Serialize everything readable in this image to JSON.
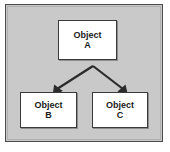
{
  "diagram": {
    "type": "hierarchy-tree",
    "title": "",
    "background_color": "#c9c9c9",
    "node_fill_color": "#ffffff",
    "node_border_color": "#3a3a3a",
    "arrow_color": "#2b2b2b",
    "nodes": [
      {
        "id": "a",
        "line1": "Object",
        "line2": "A",
        "role": "parent"
      },
      {
        "id": "b",
        "line1": "Object",
        "line2": "B",
        "role": "child"
      },
      {
        "id": "c",
        "line1": "Object",
        "line2": "C",
        "role": "child"
      }
    ],
    "edges": [
      {
        "id": "a-to-b",
        "from": "a",
        "to": "b",
        "style": "solid-arrow",
        "label": ""
      },
      {
        "id": "a-to-c",
        "from": "a",
        "to": "c",
        "style": "solid-arrow",
        "label": ""
      }
    ]
  }
}
